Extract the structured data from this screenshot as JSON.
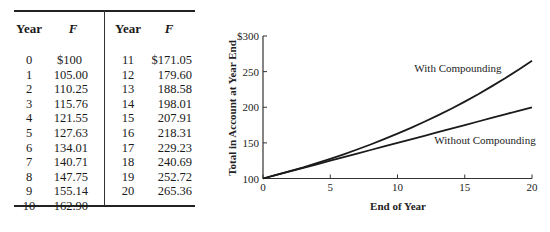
{
  "table": {
    "headers": {
      "year": "Year",
      "f": "F"
    },
    "left_rows": [
      {
        "year": "0",
        "f": "$100"
      },
      {
        "year": "1",
        "f": "105.00"
      },
      {
        "year": "2",
        "f": "110.25"
      },
      {
        "year": "3",
        "f": "115.76"
      },
      {
        "year": "4",
        "f": "121.55"
      },
      {
        "year": "5",
        "f": "127.63"
      },
      {
        "year": "6",
        "f": "134.01"
      },
      {
        "year": "7",
        "f": "140.71"
      },
      {
        "year": "8",
        "f": "147.75"
      },
      {
        "year": "9",
        "f": "155.14"
      },
      {
        "year": "10",
        "f": "162.90"
      }
    ],
    "right_rows": [
      {
        "year": "11",
        "f": "$171.05"
      },
      {
        "year": "12",
        "f": "179.60"
      },
      {
        "year": "13",
        "f": "188.58"
      },
      {
        "year": "14",
        "f": "198.01"
      },
      {
        "year": "15",
        "f": "207.91"
      },
      {
        "year": "16",
        "f": "218.31"
      },
      {
        "year": "17",
        "f": "229.23"
      },
      {
        "year": "18",
        "f": "240.69"
      },
      {
        "year": "19",
        "f": "252.72"
      },
      {
        "year": "20",
        "f": "265.36"
      }
    ]
  },
  "chart_data": {
    "type": "line",
    "title": "",
    "xlabel": "End of Year",
    "ylabel": "Total in Account at Year End",
    "xlim": [
      0,
      20
    ],
    "ylim": [
      100,
      300
    ],
    "xticks": [
      "0",
      "5",
      "10",
      "15",
      "20"
    ],
    "yticks": [
      "100",
      "150",
      "200",
      "250",
      "$300"
    ],
    "grid": false,
    "x": [
      0,
      1,
      2,
      3,
      4,
      5,
      6,
      7,
      8,
      9,
      10,
      11,
      12,
      13,
      14,
      15,
      16,
      17,
      18,
      19,
      20
    ],
    "series": [
      {
        "name": "With Compounding",
        "values": [
          100,
          105.0,
          110.25,
          115.76,
          121.55,
          127.63,
          134.01,
          140.71,
          147.75,
          155.14,
          162.9,
          171.05,
          179.6,
          188.58,
          198.01,
          207.91,
          218.31,
          229.23,
          240.69,
          252.72,
          265.36
        ]
      },
      {
        "name": "Without Compounding",
        "values": [
          100,
          105,
          110,
          115,
          120,
          125,
          130,
          135,
          140,
          145,
          150,
          155,
          160,
          165,
          170,
          175,
          180,
          185,
          190,
          195,
          200
        ]
      }
    ],
    "annotations": [
      {
        "text": "With Compounding",
        "x": 14.5,
        "y": 242
      },
      {
        "text": "Without Compounding",
        "x": 16.5,
        "y": 168
      }
    ]
  }
}
